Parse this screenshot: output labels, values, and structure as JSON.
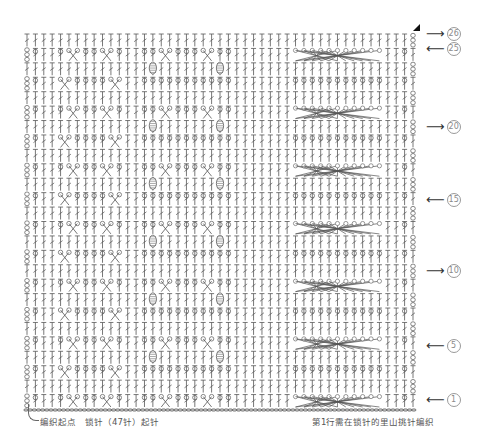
{
  "chart": {
    "rows": 26,
    "stitches": 47,
    "left": 27,
    "right": 413,
    "top": 33,
    "bottom": 408,
    "line_color": "#555555",
    "panels": [
      {
        "name": "left-cable-panel",
        "cols": [
          4,
          11
        ],
        "type": "diamond-cross"
      },
      {
        "name": "bobble-panel",
        "cols": [
          14,
          24
        ],
        "type": "bobble-cross"
      },
      {
        "name": "wide-cable-panel",
        "cols": [
          32,
          42
        ],
        "type": "wide-cross"
      }
    ]
  },
  "row_markers": [
    {
      "row": 26,
      "direction": "right",
      "arrow": "⟶",
      "label": "26",
      "y": 33
    },
    {
      "row": 25,
      "direction": "left",
      "arrow": "⟵",
      "label": "25",
      "y": 48
    },
    {
      "row": 20,
      "direction": "right",
      "arrow": "⟶",
      "label": "20",
      "y": 126
    },
    {
      "row": 15,
      "direction": "left",
      "arrow": "⟵",
      "label": "15",
      "y": 199
    },
    {
      "row": 10,
      "direction": "right",
      "arrow": "⟶",
      "label": "10",
      "y": 270
    },
    {
      "row": 5,
      "direction": "left",
      "arrow": "⟵",
      "label": "5",
      "y": 345
    },
    {
      "row": 1,
      "direction": "left",
      "arrow": "⟵",
      "label": "1",
      "y": 399
    }
  ],
  "captions": {
    "start": "编织起点　锁针（47针）起针",
    "row1_note": "第1行需在锁针的里山挑针编织"
  },
  "end_marker": "▲"
}
